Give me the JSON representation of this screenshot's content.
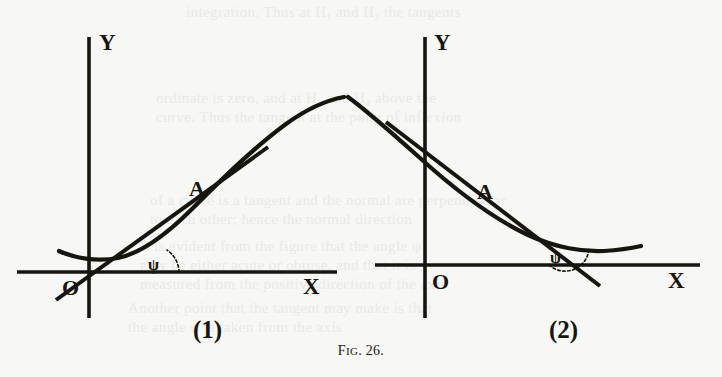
{
  "figure": {
    "caption_prefix": "F",
    "caption_smallcaps": "IG",
    "caption_suffix": ". 26.",
    "caption_full": "Fig. 26.",
    "ink_color": "#17150f",
    "paper_color": "#f7f7f5"
  },
  "panels": [
    {
      "id": "panel-1",
      "label": "(1)",
      "axis_y_label": "Y",
      "axis_x_label": "X",
      "origin_label": "O",
      "point_label": "A",
      "angle_label": "ψ",
      "description": "Curve concave upward crossing to a cusp; tangent at A makes acute angle psi with the positive x-axis, measured above the axis on the right side of the crossing point.",
      "angle_sense": "acute"
    },
    {
      "id": "panel-2",
      "label": "(2)",
      "axis_y_label": "Y",
      "axis_x_label": "X",
      "origin_label": "O",
      "point_label": "A",
      "angle_label": "ψ",
      "description": "Curve descending from the cusp and flattening; tangent at A makes an obtuse angle psi with the positive x-axis, measured above the axis at the crossing point.",
      "angle_sense": "obtuse"
    }
  ],
  "chart_data": {
    "type": "line",
    "title": "Fig. 26.",
    "xlabel": "X",
    "ylabel": "Y",
    "panels": [
      {
        "name": "(1)",
        "origin": {
          "x": 89,
          "y": 272
        },
        "y_axis": {
          "x": 89,
          "y_top": 37,
          "y_bottom": 318
        },
        "x_axis": {
          "y": 272,
          "x_left": 17,
          "x_right": 337
        },
        "curve_points": [
          [
            60,
            252
          ],
          [
            72,
            256
          ],
          [
            88,
            260
          ],
          [
            104,
            261
          ],
          [
            124,
            257
          ],
          [
            146,
            247
          ],
          [
            172,
            227
          ],
          [
            204,
            196
          ],
          [
            240,
            160
          ],
          [
            280,
            128
          ],
          [
            316,
            108
          ],
          [
            341,
            99
          ]
        ],
        "tangent_endpoints": [
          [
            58,
            297
          ],
          [
            262,
            151
          ]
        ],
        "tangent_point_A": {
          "x": 200,
          "y": 196
        },
        "angle_vertex": {
          "x": 152,
          "y": 272
        },
        "angle_arc_radius": 28,
        "angle_label_pos": {
          "x": 158,
          "y": 266
        }
      },
      {
        "name": "(2)",
        "origin": {
          "x": 425,
          "y": 265
        },
        "y_axis": {
          "x": 425,
          "y_top": 37,
          "y_bottom": 318
        },
        "x_axis": {
          "y": 265,
          "x_left": 375,
          "x_right": 700
        },
        "curve_points": [
          [
            349,
            99
          ],
          [
            372,
            112
          ],
          [
            400,
            136
          ],
          [
            432,
            166
          ],
          [
            470,
            199
          ],
          [
            506,
            223
          ],
          [
            540,
            239
          ],
          [
            570,
            247
          ],
          [
            598,
            250
          ],
          [
            622,
            249
          ],
          [
            640,
            247
          ]
        ],
        "tangent_endpoints": [
          [
            388,
            124
          ],
          [
            596,
            283
          ]
        ],
        "tangent_point_A": {
          "x": 500,
          "y": 210
        },
        "angle_vertex": {
          "x": 573,
          "y": 265
        },
        "angle_arc_radius": 24,
        "angle_label_pos": {
          "x": 556,
          "y": 259
        }
      }
    ]
  },
  "background_text": {
    "note": "faint show-through of text printed on the reverse side of the page",
    "lines": [
      {
        "text": "integration. Thus at H₁ and H₂ the tangents",
        "x": 186,
        "y": 4
      },
      {
        "text": "ordinate is zero, and at H₃ and H₄ above the",
        "x": 156,
        "y": 90
      },
      {
        "text": "curve. Thus the tangent at the point of inflexion",
        "x": 156,
        "y": 109
      },
      {
        "text": "of a curve is a tangent and the normal are perpendicular",
        "x": 150,
        "y": 192
      },
      {
        "text": "to each other; hence the normal direction",
        "x": 150,
        "y": 211
      },
      {
        "text": "It is evident from the figure that the angle ψ",
        "x": 140,
        "y": 238
      },
      {
        "text": "may be either acute or obtuse, and that it is",
        "x": 140,
        "y": 257
      },
      {
        "text": "measured from the positive direction of the axis",
        "x": 140,
        "y": 276
      },
      {
        "text": "Another point that the tangent may make is that",
        "x": 128,
        "y": 300
      },
      {
        "text": "the angle ψ is taken from the axis",
        "x": 128,
        "y": 319
      }
    ]
  }
}
